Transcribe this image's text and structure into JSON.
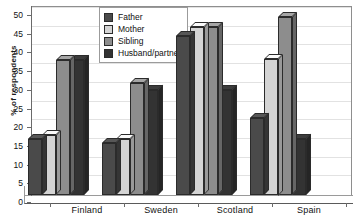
{
  "chart_data": {
    "type": "bar",
    "title": "",
    "subtitle": "",
    "xlabel": "",
    "ylabel": "% of respondents",
    "ylim": [
      0,
      50
    ],
    "ytick_step": 5,
    "yticks": [
      0,
      5,
      10,
      15,
      20,
      25,
      30,
      35,
      40,
      45,
      50
    ],
    "grid": true,
    "legend_position": "top-center",
    "three_d": true,
    "categories": [
      "Finland",
      "Sweden",
      "Scotland",
      "Spain"
    ],
    "series": [
      {
        "name": "Father",
        "color": "#4a4a4a",
        "values": [
          15,
          14,
          42.5,
          20.5
        ]
      },
      {
        "name": "Mother",
        "color": "#d4d4d4",
        "values": [
          16,
          15,
          45,
          36.5
        ]
      },
      {
        "name": "Sibling",
        "color": "#8d8d8d",
        "values": [
          36,
          30,
          45,
          47.5
        ]
      },
      {
        "name": "Husband/partner",
        "color": "#333333",
        "values": [
          36,
          28,
          28,
          15
        ]
      }
    ],
    "annotations": []
  },
  "legend": {
    "items": [
      {
        "label": "Father",
        "swatch": "#4a4a4a"
      },
      {
        "label": "Mother",
        "swatch": "#d4d4d4"
      },
      {
        "label": "Sibling",
        "swatch": "#8d8d8d"
      },
      {
        "label": "Husband/partner",
        "swatch": "#333333"
      }
    ]
  },
  "axes": {
    "y_title": "% of respondents",
    "y_labels": [
      "50",
      "45",
      "40",
      "35",
      "30",
      "25",
      "20",
      "15",
      "10",
      "5",
      "0"
    ],
    "x_labels": [
      "Finland",
      "Sweden",
      "Scotland",
      "Spain"
    ]
  },
  "colors": {
    "plot_background": "#ffffff",
    "frame": "#8e8e8e",
    "gridline": "#e2e2e2",
    "axis": "#6a6a6a",
    "text": "#111111"
  }
}
